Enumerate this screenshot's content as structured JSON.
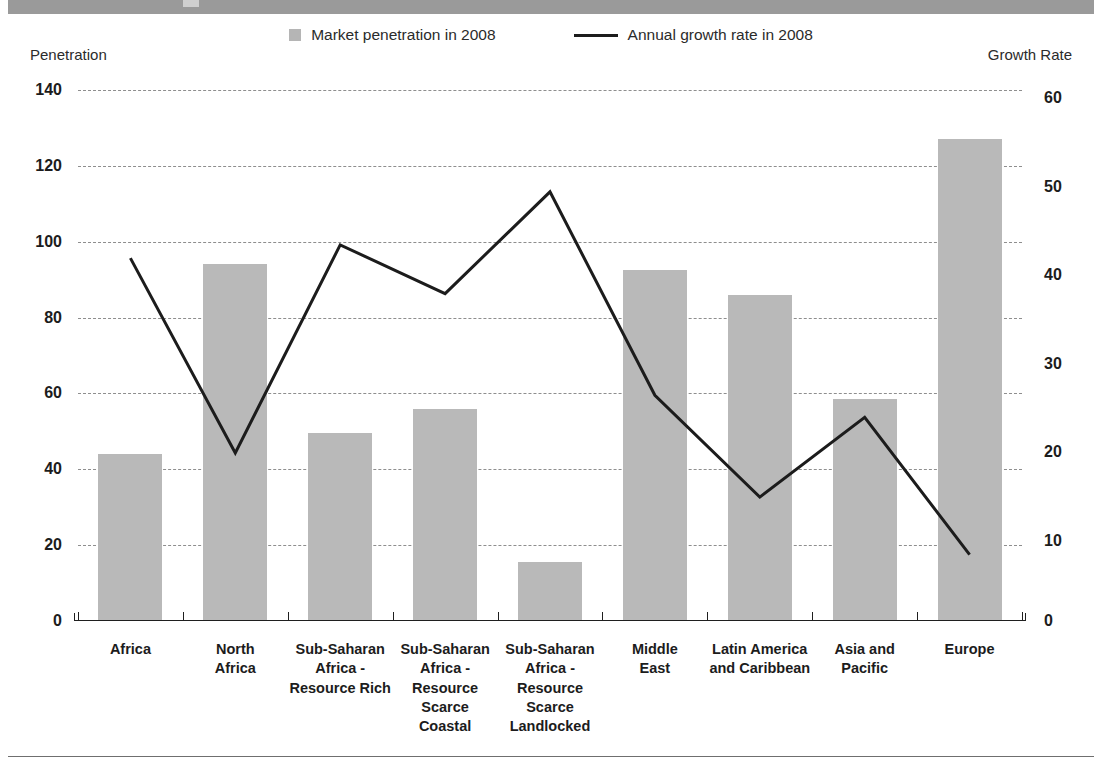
{
  "legend": {
    "bar_label": "Market penetration in 2008",
    "line_label": "Annual growth rate in 2008"
  },
  "axis_captions": {
    "left": "Penetration",
    "right": "Growth Rate"
  },
  "chart_data": {
    "type": "bar",
    "title": "",
    "xlabel": "",
    "ylabel": "Penetration",
    "y2label": "Growth Rate",
    "ylim": [
      0,
      140
    ],
    "y2lim": [
      0,
      60
    ],
    "yticks": [
      0,
      20,
      40,
      60,
      80,
      100,
      120,
      140
    ],
    "y2ticks": [
      0,
      10,
      20,
      30,
      40,
      50,
      60
    ],
    "grid": true,
    "legend_position": "top-center",
    "categories": [
      "Africa",
      "North Africa",
      "Sub-Saharan Africa - Resource Rich",
      "Sub-Saharan Africa - Resource Scarce Coastal",
      "Sub-Saharan Africa - Resource Scarce Landlocked",
      "Middle East",
      "Latin America and Caribbean",
      "Asia and Pacific",
      "Europe"
    ],
    "category_lines": [
      [
        "Africa"
      ],
      [
        "North",
        "Africa"
      ],
      [
        "Sub-Saharan",
        "Africa -",
        "Resource Rich"
      ],
      [
        "Sub-Saharan",
        "Africa -",
        "Resource",
        "Scarce",
        "Coastal"
      ],
      [
        "Sub-Saharan",
        "Africa -",
        "Resource",
        "Scarce",
        "Landlocked"
      ],
      [
        "Middle",
        "East"
      ],
      [
        "Latin America",
        "and Caribbean"
      ],
      [
        "Asia and",
        "Pacific"
      ],
      [
        "Europe"
      ]
    ],
    "series": [
      {
        "name": "Market penetration in 2008",
        "type": "bar",
        "axis": "left",
        "color": "#b9b9b9",
        "values": [
          44,
          94,
          49.5,
          56,
          15.5,
          92.5,
          86,
          58.5,
          127
        ]
      },
      {
        "name": "Annual growth rate in 2008",
        "type": "line",
        "axis": "right",
        "color": "#1c1c1c",
        "values": [
          41,
          19,
          42.5,
          37,
          48.5,
          25.5,
          14,
          23,
          7.5
        ]
      }
    ]
  }
}
